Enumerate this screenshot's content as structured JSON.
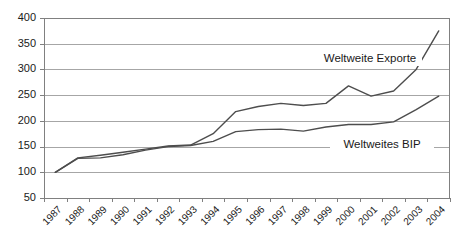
{
  "chart_data": {
    "type": "line",
    "title": "",
    "xlabel": "",
    "ylabel": "",
    "ylim": [
      50,
      400
    ],
    "y_ticks": [
      50,
      100,
      150,
      200,
      250,
      300,
      350,
      400
    ],
    "grid": true,
    "legend_position": "inline-annotation",
    "categories": [
      "1987",
      "1988",
      "1989",
      "1990",
      "1991",
      "1992",
      "1993",
      "1994",
      "1995",
      "1996",
      "1997",
      "1998",
      "1999",
      "2000",
      "2001",
      "2002",
      "2003",
      "2004"
    ],
    "series": [
      {
        "name": "Weltweite Exporte",
        "values": [
          100,
          128,
          133,
          139,
          145,
          151,
          153,
          175,
          218,
          228,
          234,
          230,
          234,
          268,
          248,
          258,
          300,
          375
        ],
        "annotation": "Weltweite Exporte",
        "color": "#4d4d4d"
      },
      {
        "name": "Weltweites BIP",
        "values": [
          100,
          127,
          128,
          134,
          143,
          150,
          152,
          160,
          179,
          183,
          184,
          180,
          188,
          193,
          193,
          198,
          222,
          248
        ],
        "annotation": "Weltweites BIP",
        "color": "#4d4d4d"
      }
    ]
  },
  "colors": {
    "background": "#ffffff",
    "gridline": "#a6a6a6",
    "axis": "#808080",
    "line": "#4d4d4d",
    "text": "#1a1a1a"
  }
}
